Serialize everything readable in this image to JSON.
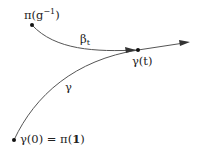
{
  "diagram": {
    "labels": {
      "start_point": "π(g",
      "start_exp": "−1",
      "start_close": ")",
      "beta": "β",
      "beta_sub": "t",
      "gamma": "γ",
      "gamma_t": "γ(t)",
      "origin": "γ(0) = π(",
      "origin_bold": "1",
      "origin_close": ")"
    },
    "colors": {
      "stroke": "#555555",
      "dot": "#111111",
      "text": "#222222"
    }
  }
}
